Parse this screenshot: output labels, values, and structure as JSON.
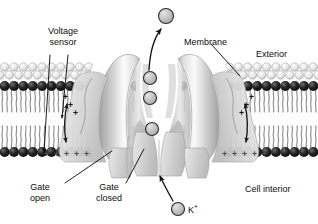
{
  "figure": {
    "background_color": "#ffffff"
  },
  "labels": {
    "voltage_sensor": "Voltage\nsensor",
    "membrane": "Membrane",
    "exterior": "Exterior",
    "gate_open": "Gate\nopen",
    "gate_closed": "Gate\nclosed",
    "cell_interior": "Cell interior",
    "ion_species": "K",
    "ion_charge": "+"
  },
  "colors": {
    "text": "#0d0d0d",
    "leader_line": "#111111",
    "headgroup_outer": "#c9c9c9",
    "headgroup_dark": "#1a1a1a",
    "tail": "#8a8a8a",
    "protein_light": "#f2f2f2",
    "protein_mid": "#c4c4c4",
    "protein_dark": "#9a9a9a",
    "ion_fill": "#bdbdbd",
    "ion_stroke": "#2b2b2b",
    "plus_sign": "#1a1a1a",
    "interior_fill": "#ffffff"
  },
  "structures": {
    "membrane": {
      "name": "lipid-bilayer",
      "top_y": 64,
      "bottom_y": 160,
      "outer_leaflet_head_rows": 2,
      "inner_leaflet_head_rows": 1,
      "head_count_per_row": 34
    },
    "channel": {
      "name": "potassium-channel-protein",
      "subunits": 2,
      "pore_axis_x": 159,
      "gate_open_side": "left",
      "gate_closed_side": "center"
    },
    "voltage_sensors": [
      {
        "side": "left",
        "charge_signs": 4,
        "charge_symbol": "+"
      },
      {
        "side": "right",
        "charge_signs": 4,
        "charge_symbol": "+"
      }
    ],
    "inner_charge_rows": [
      {
        "side": "left",
        "count": 5,
        "symbol": "+"
      },
      {
        "side": "right",
        "count": 5,
        "symbol": "+"
      }
    ]
  },
  "ions": [
    {
      "id": "ion-exiting",
      "label": "K+",
      "x": 166,
      "y": 16,
      "r": 7.5,
      "location": "exterior"
    },
    {
      "id": "ion-pore-upper",
      "label": "K+",
      "x": 150,
      "y": 78,
      "r": 6.5,
      "location": "selectivity-filter"
    },
    {
      "id": "ion-pore-mid",
      "label": "K+",
      "x": 150,
      "y": 98,
      "r": 6.5,
      "location": "pore"
    },
    {
      "id": "ion-pore-lower",
      "label": "K+",
      "x": 152,
      "y": 129,
      "r": 6.5,
      "location": "cavity"
    },
    {
      "id": "ion-legend",
      "label": "K+",
      "x": 178,
      "y": 209,
      "r": 6.5,
      "location": "legend"
    }
  ],
  "arrows": [
    {
      "id": "arrow-ion-exit",
      "type": "curved",
      "from": "pore-exit",
      "to": "exterior",
      "direction": "up-right"
    },
    {
      "id": "arrow-ion-entry",
      "type": "curved",
      "from": "cell-interior",
      "to": "gate-closed",
      "direction": "up-left"
    },
    {
      "id": "arrow-sensor-left",
      "type": "double",
      "from": "sensor-top",
      "to": "sensor-bottom",
      "direction": "vertical"
    },
    {
      "id": "arrow-sensor-right",
      "type": "double",
      "from": "sensor-top",
      "to": "sensor-bottom",
      "direction": "vertical"
    }
  ],
  "leader_lines": [
    {
      "id": "leader-voltage-sensor-a",
      "label": "voltage_sensor",
      "x1": 64,
      "y1": 54,
      "x2": 48,
      "y2": 156
    },
    {
      "id": "leader-voltage-sensor-b",
      "label": "voltage_sensor",
      "x1": 76,
      "y1": 54,
      "x2": 64,
      "y2": 86
    },
    {
      "id": "leader-membrane",
      "label": "membrane",
      "x1": 213,
      "y1": 44,
      "x2": 243,
      "y2": 78
    },
    {
      "id": "leader-gate-open",
      "label": "gate_open",
      "x1": 66,
      "y1": 184,
      "x2": 112,
      "y2": 152
    },
    {
      "id": "leader-gate-closed",
      "label": "gate_closed",
      "x1": 125,
      "y1": 184,
      "x2": 143,
      "y2": 150
    }
  ]
}
